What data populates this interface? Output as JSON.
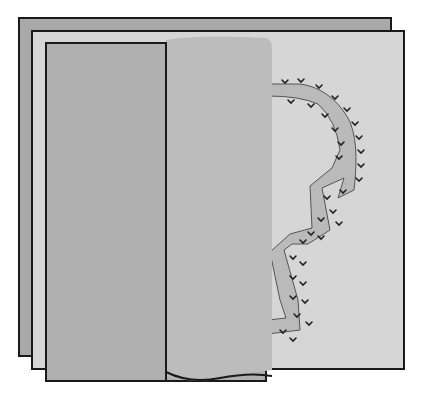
{
  "figure": {
    "caption_partial": ""
  },
  "colors": {
    "background": "#ffffff",
    "back_sheet": "#a9a9a9",
    "middle_sheet": "#d4d4d4",
    "inner_panel": "#b0b0b0",
    "folded_flap": "#bdbdbd",
    "seam_strip": "#b8b8b8",
    "outline": "#1a1a1a",
    "stitch": "#222222"
  },
  "layers": [
    {
      "name": "back-sheet",
      "x": 19,
      "y": 18,
      "w": 372,
      "h": 338
    },
    {
      "name": "middle-sheet",
      "x": 32,
      "y": 31,
      "w": 372,
      "h": 338
    },
    {
      "name": "inner-panel",
      "x": 46,
      "y": 43,
      "w": 120,
      "h": 338
    },
    {
      "name": "folded-flap",
      "x": 166,
      "y": 35,
      "w": 106,
      "h": 346
    }
  ]
}
